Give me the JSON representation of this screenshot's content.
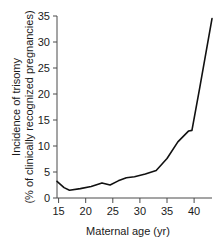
{
  "chart_data": {
    "type": "line",
    "title": "",
    "xlabel": "Maternal age (yr)",
    "ylabel_line1": "Incidence of trisomy",
    "ylabel_line2": "(% of clinically recognized pregnancies)",
    "xlim": [
      14.7,
      43.3
    ],
    "ylim": [
      0,
      35
    ],
    "xticks": [
      15,
      20,
      25,
      30,
      35,
      40
    ],
    "yticks": [
      0,
      5,
      10,
      15,
      20,
      25,
      30,
      35
    ],
    "grid": false,
    "legend": "none",
    "line_color": "#111111",
    "series": [
      {
        "name": "Incidence of trisomy",
        "x": [
          14.7,
          16.0,
          17.0,
          19.0,
          21.0,
          23.0,
          24.5,
          26.0,
          27.5,
          29.0,
          31.0,
          33.0,
          35.0,
          37.0,
          39.0,
          39.6,
          41.0,
          43.3
        ],
        "values": [
          3.2,
          2.0,
          1.5,
          1.8,
          2.2,
          2.9,
          2.5,
          3.3,
          3.9,
          4.1,
          4.6,
          5.3,
          7.6,
          10.8,
          12.9,
          13.0,
          21.0,
          34.5
        ]
      }
    ]
  }
}
